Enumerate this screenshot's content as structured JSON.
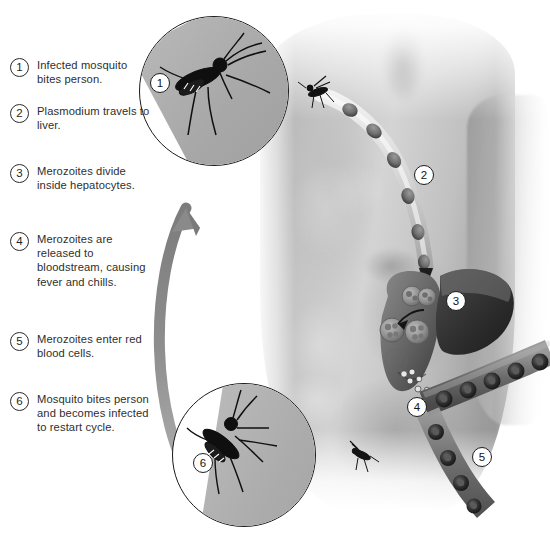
{
  "figure": {
    "background_color": "#ffffff",
    "text_color": "#2e2e2e",
    "badge_border_color": "#1d1d1d",
    "arrow_color": "#8e8e8e"
  },
  "legend": {
    "items": [
      {
        "number": "1",
        "text": "Infected mosquito bites person."
      },
      {
        "number": "2",
        "text": "Plasmodium travels to liver."
      },
      {
        "number": "3",
        "text": "Merozoites divide inside hepatocytes."
      },
      {
        "number": "4",
        "text": "Merozoites are released to bloodstream, causing fever and chills."
      },
      {
        "number": "5",
        "text": "Merozoites enter red blood cells."
      },
      {
        "number": "6",
        "text": "Mosquito bites person and becomes infected to restart cycle."
      }
    ]
  },
  "artwork": {
    "badges": [
      {
        "id": "badge-1",
        "number": "1",
        "refers_to": "mosquito-biting-skin-inset"
      },
      {
        "id": "badge-2",
        "number": "2",
        "refers_to": "blood-vessel-sporozoites-shoulder"
      },
      {
        "id": "badge-3",
        "number": "3",
        "refers_to": "liver-hepatocytes"
      },
      {
        "id": "badge-4",
        "number": "4",
        "refers_to": "merozoites-released-bloodstream"
      },
      {
        "id": "badge-5",
        "number": "5",
        "refers_to": "red-blood-cells-vessel"
      },
      {
        "id": "badge-6",
        "number": "6",
        "refers_to": "mosquito-reinfected-inset"
      }
    ],
    "insets": [
      {
        "id": "inset-1",
        "number": "1",
        "caption": "Mosquito biting human skin"
      },
      {
        "id": "inset-6",
        "number": "6",
        "caption": "Mosquito feeding on human skin"
      }
    ],
    "anatomy": {
      "subject": "Human torso, grayscale photograph",
      "organs": [
        "liver",
        "blood vessel",
        "red blood cells"
      ],
      "mosquitoes_on_body": 2
    },
    "cycle_arrow": {
      "from": "inset-6",
      "to": "inset-1",
      "direction": "upward-curved",
      "color": "#8e8e8e"
    }
  }
}
